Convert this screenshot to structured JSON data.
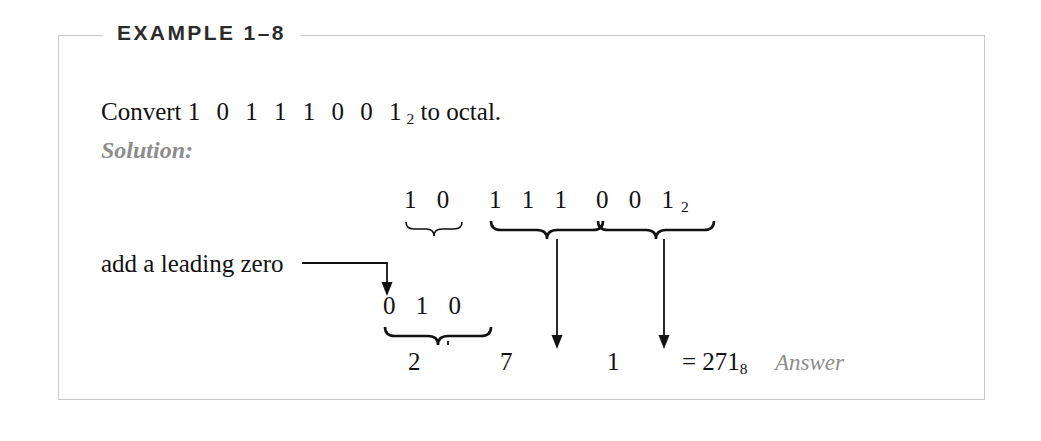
{
  "header": {
    "title": "EXAMPLE 1–8"
  },
  "body": {
    "statement_prefix": "Convert ",
    "statement_bits": "1 0 1 1 1 0 0 1",
    "statement_bits_subscript": "2",
    "statement_suffix": " to octal.",
    "solution_label": "Solution:"
  },
  "work": {
    "annotation": "add a leading zero",
    "top_groups": [
      {
        "digits": "1 0",
        "subscript": ""
      },
      {
        "digits": "1 1 1",
        "subscript": ""
      },
      {
        "digits": "0 0 1",
        "subscript": "2"
      }
    ],
    "padded_group": {
      "digits": "0 1 0",
      "subscript": ""
    },
    "octal_digits": [
      "2",
      "7",
      "1"
    ],
    "result": "= 271",
    "result_subscript": "8",
    "answer_label": "Answer"
  },
  "colors": {
    "ink": "#111111",
    "muted": "#8d8d8d",
    "border": "#c9c9c9",
    "background": "#ffffff"
  }
}
